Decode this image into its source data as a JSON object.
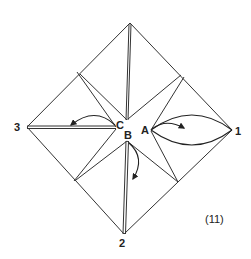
{
  "figure": {
    "caption": "(11)",
    "labels": {
      "corner_right": "1",
      "corner_bottom": "2",
      "corner_left": "3",
      "point_a": "A",
      "point_b": "B",
      "point_c": "C"
    },
    "colors": {
      "line": "#333333",
      "background": "#ffffff"
    }
  }
}
